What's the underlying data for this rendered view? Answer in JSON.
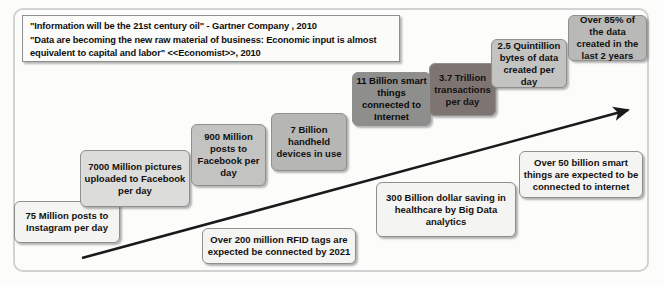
{
  "quote": {
    "line1": "\"Information will be the 21st century oil\"  - Gartner Company , 2010",
    "line2": "\"Data are becoming the new raw material of business: Economic input is almost",
    "line3": "equivalent to capital and labor\" <<Economist>>, 2010"
  },
  "colors": {
    "frame_border": "#d2d2d2",
    "box_border": "#8f8f8f",
    "arrow": "#1a1a1a",
    "shade_light": "#f4f4f2",
    "shade_gray1": "#dcdcda",
    "shade_gray2": "#c3c3c1",
    "shade_gray3": "#b6b6b4",
    "shade_gray4": "#9a9a98",
    "shade_gray5": "#8e8e8c",
    "shade_dark": "#7e7572"
  },
  "boxes": [
    {
      "id": "instagram-posts",
      "text": "75 Million posts to Instagram per day"
    },
    {
      "id": "facebook-pictures",
      "text": "7000  Million pictures uploaded to Facebook per day"
    },
    {
      "id": "facebook-posts",
      "text": "900  Million posts to Facebook per day"
    },
    {
      "id": "handheld-devices",
      "text": "7 Billion handheld devices in use"
    },
    {
      "id": "smart-things-iot",
      "text": "11 Billion smart things connected to Internet"
    },
    {
      "id": "transactions-per-day",
      "text": "3.7 Trillion transactions per day"
    },
    {
      "id": "quintillion-bytes",
      "text": "2.5 Quintillion bytes of data created per day"
    },
    {
      "id": "data-last-two-years",
      "text": "Over 85% of the data created in the last 2 years"
    },
    {
      "id": "rfid-tags",
      "text": "Over 200 million RFID tags are expected be connected by 2021"
    },
    {
      "id": "healthcare-saving",
      "text": "300 Billion dollar saving in healthcare by Big Data analytics"
    },
    {
      "id": "smart-things-future",
      "text": "Over 50 billion smart things are expected to be connected to internet"
    }
  ]
}
